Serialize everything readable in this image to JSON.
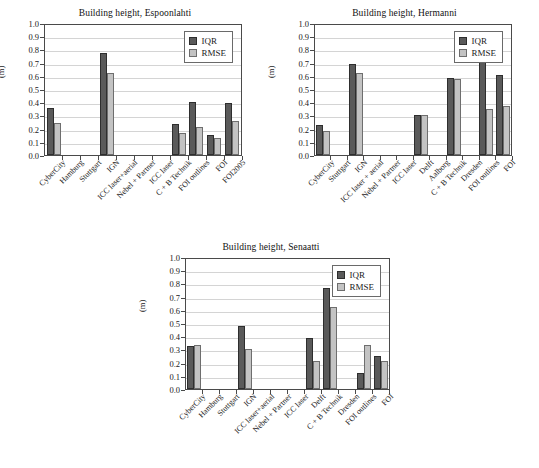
{
  "figure": {
    "ylabel": "(m)",
    "legend": {
      "iqr": "IQR",
      "rmse": "RMSE"
    },
    "colors": {
      "iqr": "#5a5a5a",
      "rmse": "#c3c3c3",
      "grid": "#d4d4d4",
      "axis": "#4a4a4a",
      "background": "#ffffff"
    },
    "yticks": [
      "1.0",
      "0.9",
      "0.8",
      "0.7",
      "0.6",
      "0.5",
      "0.4",
      "0.3",
      "0.2",
      "0.1",
      "0.0"
    ]
  },
  "chart_data": [
    {
      "type": "bar",
      "title": "Building height, Espoonlahti",
      "xlabel": "",
      "ylabel": "(m)",
      "ylim": [
        0,
        1.0
      ],
      "ytick_step": 0.1,
      "grid": true,
      "legend_position": "top-right",
      "categories": [
        "CyberCity",
        "Hamburg",
        "Stuttgart",
        "IGN",
        "ICC laser+aerial",
        "Nebel + Partner",
        "ICC laser",
        "C + B Technik",
        "FOI outlines",
        "FOI",
        "FOI2005"
      ],
      "series": [
        {
          "name": "IQR",
          "values": [
            0.355,
            0,
            0,
            0.77,
            0,
            0,
            0,
            0.235,
            0.405,
            0.155,
            0.395
          ]
        },
        {
          "name": "RMSE",
          "values": [
            0.24,
            0,
            0,
            0.62,
            0,
            0,
            0,
            0.165,
            0.215,
            0.13,
            0.26
          ]
        }
      ]
    },
    {
      "type": "bar",
      "title": "Building height, Hermanni",
      "xlabel": "",
      "ylabel": "(m)",
      "ylim": [
        0,
        1.0
      ],
      "ytick_step": 0.1,
      "grid": true,
      "legend_position": "top-right",
      "categories": [
        "CyberCity",
        "Stuttgart",
        "IGN",
        "ICC laser + aerial",
        "Nebel + Partner",
        "ICC laser",
        "Delft",
        "Aalborg",
        "C + B Technik",
        "Dresden",
        "FOI outlines",
        "FOI"
      ],
      "series": [
        {
          "name": "IQR",
          "values": [
            0.23,
            0,
            0.69,
            0,
            0,
            0,
            0.3,
            0,
            0.585,
            0,
            0.71,
            0.605
          ]
        },
        {
          "name": "RMSE",
          "values": [
            0.18,
            0,
            0.625,
            0,
            0,
            0,
            0.3,
            0,
            0.575,
            0,
            0.345,
            0.375
          ]
        }
      ]
    },
    {
      "type": "bar",
      "title": "Building height, Senaatti",
      "xlabel": "",
      "ylabel": "(m)",
      "ylim": [
        0,
        1.0
      ],
      "ytick_step": 0.1,
      "grid": true,
      "legend_position": "top-right",
      "categories": [
        "CyberCity",
        "Hamburg",
        "Stuttgart",
        "IGN",
        "ICC laser+aerial",
        "Nebel + Partner",
        "ICC laser",
        "Delft",
        "C + B Technik",
        "Dresden",
        "FOI outlines",
        "FOI"
      ],
      "series": [
        {
          "name": "IQR",
          "values": [
            0.325,
            0,
            0,
            0.48,
            0,
            0,
            0,
            0.39,
            0.765,
            0,
            0.125,
            0.25
          ]
        },
        {
          "name": "RMSE",
          "values": [
            0.33,
            0,
            0,
            0.305,
            0,
            0,
            0,
            0.21,
            0.625,
            0,
            0.33,
            0.21
          ]
        }
      ]
    }
  ]
}
